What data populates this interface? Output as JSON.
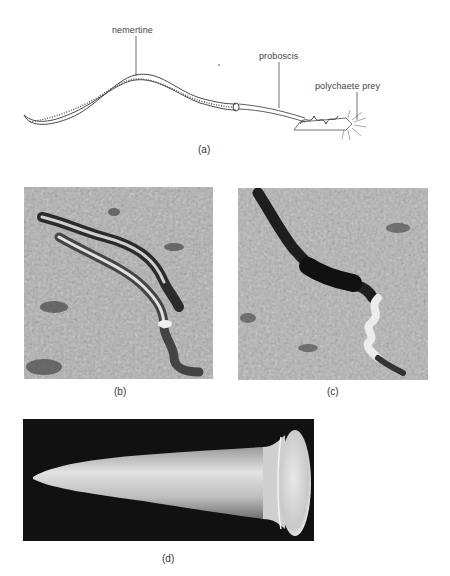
{
  "figure": {
    "panel_a": {
      "caption": "(a)",
      "labels": {
        "nemertine": "nemertine",
        "proboscis": "proboscis",
        "prey": "polychaete prey"
      }
    },
    "panel_b": {
      "caption": "(b)"
    },
    "panel_c": {
      "caption": "(c)"
    },
    "panel_d": {
      "caption": "(d)"
    }
  },
  "colors": {
    "background": "#ffffff",
    "line_art": "#333333",
    "soil_light": "#b8b8b8",
    "soil_dark": "#6a6a6a",
    "sem_background": "#111111",
    "sem_object": "#d8d8d8"
  }
}
